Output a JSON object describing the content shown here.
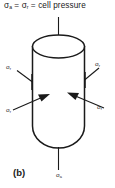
{
  "figure": {
    "caption": "(b)",
    "title_equation": {
      "axial_symbol": "σ",
      "axial_subscript": "a",
      "equals_1": " = ",
      "radial_symbol": "σ",
      "radial_subscript": "r",
      "equals_2": " = ",
      "description": "cell pressure",
      "full_text": "σa = σr = cell pressure"
    },
    "labels": {
      "top_left_radial": {
        "symbol": "σ",
        "subscript": "r"
      },
      "top_right_radial": {
        "symbol": "σ",
        "subscript": "r"
      },
      "bottom_left_radial": {
        "symbol": "σ",
        "subscript": "r"
      },
      "bottom_right_radial": {
        "symbol": "σ",
        "subscript": "r"
      },
      "bottom_axial": {
        "symbol": "σ",
        "subscript": "a"
      }
    },
    "colors": {
      "ink": "#1a1a1a",
      "background": "#ffffff"
    },
    "specimen": {
      "shape": "cylinder",
      "description": "triaxial test specimen with axial and radial stresses"
    }
  }
}
